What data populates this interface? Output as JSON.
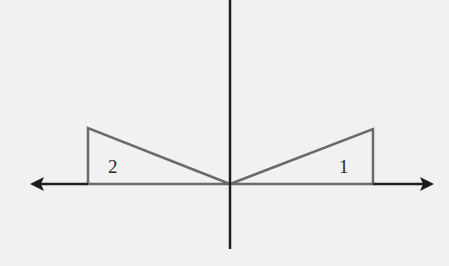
{
  "diagram": {
    "colors": {
      "background": "#f1f1f1",
      "axis": "#1e1e1e",
      "triangle": "#6a6a6a",
      "label": "#2a2a2a"
    },
    "origin": {
      "x": 230,
      "y": 184
    },
    "x_axis": {
      "left_tip": 30,
      "right_tip": 433,
      "y": 184
    },
    "y_axis": {
      "top": 0,
      "bottom": 249,
      "x": 230
    },
    "triangles": [
      {
        "label": "1",
        "vertices": [
          [
            230,
            184
          ],
          [
            373,
            129
          ],
          [
            373,
            184
          ]
        ]
      },
      {
        "label": "2",
        "vertices": [
          [
            230,
            184
          ],
          [
            88,
            128
          ],
          [
            88,
            184
          ]
        ]
      }
    ],
    "labels": {
      "triangle_1": "1",
      "triangle_2": "2"
    }
  }
}
